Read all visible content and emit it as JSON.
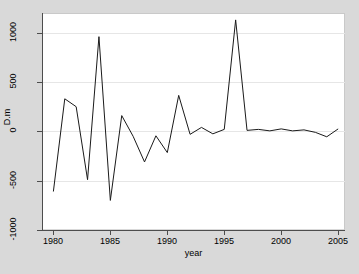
{
  "figure": {
    "background_color": "#d9d9d9",
    "plot_background_color": "#ffffff",
    "line_color": "#1a1a1a",
    "gridline_color": "#e6e6e6",
    "axis_color": "#4d4d4d"
  },
  "chart_data": {
    "type": "line",
    "title": "",
    "subtitle": "",
    "xlabel": "year",
    "ylabel": "D.m",
    "xlim": [
      1979.0,
      2005.6
    ],
    "ylim": [
      -1000,
      1200
    ],
    "xticks": [
      1980,
      1985,
      1990,
      1995,
      2000,
      2005
    ],
    "xticklabels": [
      "1980",
      "1985",
      "1990",
      "1995",
      "2000",
      "2005"
    ],
    "yticks": [
      -1000,
      -500,
      0,
      500,
      1000
    ],
    "yticklabels": [
      "-1000",
      "-500",
      "0",
      "500",
      "1000"
    ],
    "grid": "horizontal",
    "legend": "none",
    "series": [
      {
        "name": "D.m",
        "x": [
          1980,
          1981,
          1982,
          1983,
          1984,
          1985,
          1986,
          1987,
          1988,
          1989,
          1990,
          1991,
          1992,
          1993,
          1994,
          1995,
          1996,
          1997,
          1998,
          1999,
          2000,
          2001,
          2002,
          2003,
          2004,
          2005
        ],
        "values": [
          -610,
          330,
          250,
          -490,
          960,
          -700,
          160,
          -50,
          -310,
          -45,
          -215,
          365,
          -30,
          40,
          -25,
          20,
          1130,
          10,
          20,
          5,
          25,
          5,
          15,
          -10,
          -55,
          25
        ]
      }
    ]
  }
}
